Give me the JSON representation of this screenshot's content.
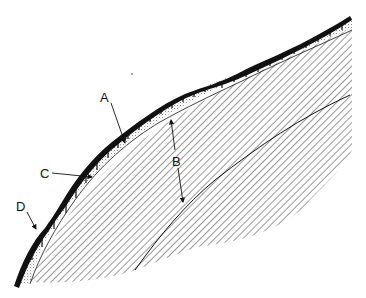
{
  "diagram": {
    "type": "cross-section",
    "labels": [
      {
        "id": "A",
        "text": "A",
        "x": 100,
        "y": 91
      },
      {
        "id": "B",
        "text": "B",
        "x": 172,
        "y": 155
      },
      {
        "id": "C",
        "text": "C",
        "x": 40,
        "y": 167
      },
      {
        "id": "D",
        "text": "D",
        "x": 16,
        "y": 200
      }
    ],
    "colors": {
      "ink": "#111111",
      "background": "#ffffff",
      "stipple": "#9a9a9a"
    }
  }
}
